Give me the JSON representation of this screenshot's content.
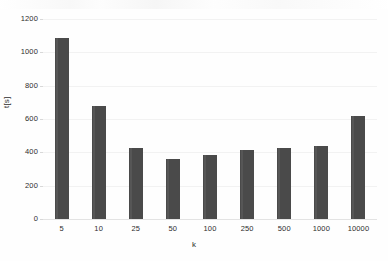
{
  "chart_data": {
    "type": "bar",
    "title": "",
    "subtitle": "",
    "xlabel": "k",
    "ylabel": "t[s]",
    "categories": [
      "5",
      "10",
      "25",
      "50",
      "100",
      "250",
      "500",
      "1000",
      "10000"
    ],
    "values": [
      1085,
      680,
      428,
      360,
      385,
      412,
      428,
      437,
      617
    ],
    "series": [
      {
        "name": "t[s]",
        "values": [
          1085,
          680,
          428,
          360,
          385,
          412,
          428,
          437,
          617
        ]
      }
    ],
    "ylim": [
      0,
      1200
    ],
    "yticks": [
      "0",
      "200",
      "400",
      "600",
      "800",
      "1000",
      "1200"
    ],
    "ytick_values": [
      0,
      200,
      400,
      600,
      800,
      1000,
      1200
    ],
    "grid": "horizontal",
    "legend": "none",
    "bar_color": "#4a4a4a",
    "gridline_color": "#f2f2f2",
    "text_color": "#2d2d2d",
    "background_color": "#ffffff",
    "annotations": []
  }
}
